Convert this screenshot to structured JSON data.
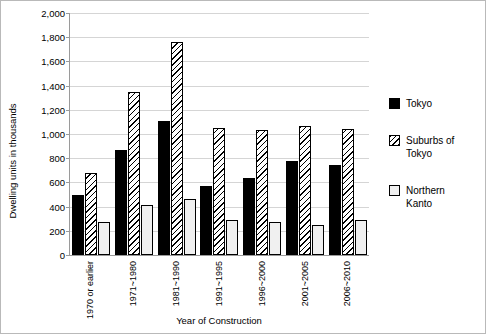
{
  "chart_data": {
    "type": "bar",
    "title": "",
    "xlabel": "Year of Construction",
    "ylabel": "Dwelling  units  in  thousands",
    "categories": [
      "1970 or earlier",
      "1971~1980",
      "1981~1990",
      "1991~1995",
      "1996~2000",
      "2001~2005",
      "2006~2010"
    ],
    "series": [
      {
        "name": "Tokyo",
        "values": [
          500,
          870,
          1110,
          570,
          640,
          780,
          740
        ]
      },
      {
        "name": "Suburbs of\nTokyo",
        "values": [
          680,
          1350,
          1760,
          1050,
          1030,
          1070,
          1040
        ]
      },
      {
        "name": "Northern\nKanto",
        "values": [
          270,
          410,
          460,
          290,
          270,
          250,
          290
        ]
      }
    ],
    "ylim": [
      0,
      2000
    ],
    "yticks": [
      0,
      200,
      400,
      600,
      800,
      1000,
      1200,
      1400,
      1600,
      1800,
      2000
    ],
    "ytick_labels": [
      "0",
      "200",
      "400",
      "600",
      "800",
      "1,000",
      "1,200",
      "1,400",
      "1,600",
      "1,800",
      "2,000"
    ],
    "grid": true,
    "legend_position": "right"
  }
}
